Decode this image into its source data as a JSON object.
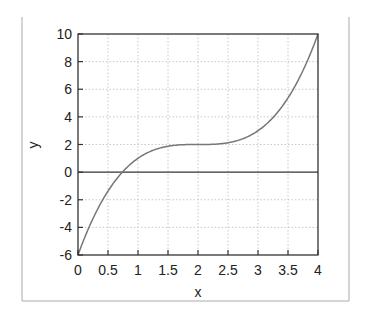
{
  "chart_data": {
    "type": "line",
    "title": "",
    "xlabel": "x",
    "ylabel": "y",
    "xlim": [
      0,
      4
    ],
    "ylim": [
      -6,
      10
    ],
    "xticks": [
      0,
      0.5,
      1,
      1.5,
      2,
      2.5,
      3,
      3.5,
      4
    ],
    "xtick_labels": [
      "0",
      "0.5",
      "1",
      "1.5",
      "2",
      "2.5",
      "3",
      "3.5",
      "4"
    ],
    "yticks": [
      -6,
      -4,
      -2,
      0,
      2,
      4,
      6,
      8,
      10
    ],
    "ytick_labels": [
      "-6",
      "-4",
      "-2",
      "0",
      "2",
      "4",
      "6",
      "8",
      "10"
    ],
    "grid": true,
    "zero_line": true,
    "legend": null,
    "series": [
      {
        "name": "y = (x-2)^3 + 2",
        "x": [
          0,
          0.25,
          0.5,
          0.75,
          1,
          1.25,
          1.5,
          1.75,
          2,
          2.25,
          2.5,
          2.75,
          3,
          3.25,
          3.5,
          3.75,
          4
        ],
        "y": [
          -6,
          -3.36,
          -1.38,
          0.05,
          1,
          1.58,
          1.88,
          1.98,
          2,
          2.02,
          2.13,
          2.42,
          3,
          3.95,
          5.38,
          7.36,
          10
        ],
        "color": "#777777"
      }
    ]
  },
  "colors": {
    "curve": "#777777",
    "grid": "#c8c8c8",
    "axis": "#333333",
    "frame": "#aaaaaa"
  }
}
